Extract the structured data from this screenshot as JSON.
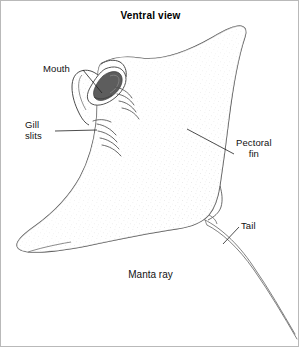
{
  "figure": {
    "title": "Ventral view",
    "caption": "Manta ray",
    "style": "black-and-white stippled line drawing",
    "colors": {
      "background": "#ffffff",
      "outline": "#3a3a3a",
      "stipple": "#9a9a9a",
      "mouth_fill": "#555555",
      "text": "#111111",
      "border": "#b9b9b9"
    }
  },
  "labels": {
    "mouth": "Mouth",
    "gill_line1": "Gill",
    "gill_line2": "slits",
    "pectoral_line1": "Pectoral",
    "pectoral_line2": "fin",
    "tail": "Tail"
  },
  "leader_lines": [
    {
      "name": "mouth-leader",
      "from": [
        82,
        69
      ],
      "to": [
        101,
        92
      ]
    },
    {
      "name": "gill-leader",
      "from": [
        54,
        130
      ],
      "to": [
        96,
        129
      ]
    },
    {
      "name": "pectoral-leader",
      "from": [
        186,
        128
      ],
      "to": [
        233,
        153
      ]
    },
    {
      "name": "tail-leader",
      "from": [
        238,
        226
      ],
      "to": [
        222,
        243
      ]
    }
  ]
}
